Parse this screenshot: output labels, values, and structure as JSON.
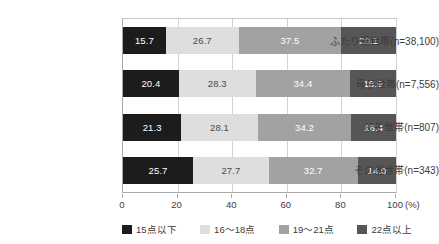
{
  "chart_data": {
    "type": "bar",
    "orientation": "horizontal",
    "stacked": true,
    "normalized_percent": true,
    "title": "",
    "subtitle": "",
    "xlabel": "",
    "ylabel": "",
    "xlim": [
      0,
      100
    ],
    "xticks": [
      "0",
      "20",
      "40",
      "60",
      "80",
      "100"
    ],
    "xtick_values": [
      0,
      20,
      40,
      60,
      80,
      100
    ],
    "axis_unit": "(%)",
    "grid": true,
    "grid_axis": "x",
    "legend_position": "bottom",
    "categories": [
      "ふたり親世帯(n=38,100)",
      "母子世帯(n=7,556)",
      "父子世帯(n=807)",
      "その他世帯(n=343)"
    ],
    "series": [
      {
        "name": "15点以下",
        "color": "#1c1c1c",
        "values": [
          15.7,
          20.4,
          21.3,
          25.7
        ]
      },
      {
        "name": "16～18点",
        "color": "#dedede",
        "values": [
          26.7,
          28.3,
          28.1,
          27.7
        ]
      },
      {
        "name": "19～21点",
        "color": "#a2a2a2",
        "values": [
          37.5,
          34.4,
          34.2,
          32.7
        ]
      },
      {
        "name": "22点以上",
        "color": "#565656",
        "values": [
          20.1,
          16.9,
          16.4,
          14.0
        ]
      }
    ],
    "data_labels": [
      [
        "15.7",
        "26.7",
        "37.5",
        "20.1"
      ],
      [
        "20.4",
        "28.3",
        "34.4",
        "16.9"
      ],
      [
        "21.3",
        "28.1",
        "34.2",
        "16.4"
      ],
      [
        "25.7",
        "27.7",
        "32.7",
        "14.0"
      ]
    ]
  }
}
